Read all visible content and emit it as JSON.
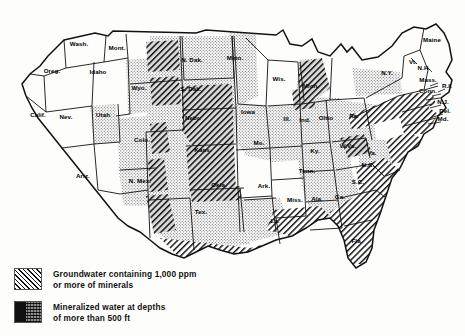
{
  "map": {
    "title": "Groundwater mineral content map of the contiguous United States",
    "states": [
      {
        "abbr": "Wash.",
        "x": 79,
        "y": 46
      },
      {
        "abbr": "Oreg.",
        "x": 52,
        "y": 73
      },
      {
        "abbr": "Calif.",
        "x": 38,
        "y": 117
      },
      {
        "abbr": "Idaho",
        "x": 98,
        "y": 74
      },
      {
        "abbr": "Mont.",
        "x": 117,
        "y": 50
      },
      {
        "abbr": "Wyo.",
        "x": 139,
        "y": 90
      },
      {
        "abbr": "Nev.",
        "x": 66,
        "y": 119
      },
      {
        "abbr": "Utah",
        "x": 103,
        "y": 117
      },
      {
        "abbr": "Colo.",
        "x": 142,
        "y": 142
      },
      {
        "abbr": "Ariz.",
        "x": 83,
        "y": 178
      },
      {
        "abbr": "N. Mex.",
        "x": 140,
        "y": 183
      },
      {
        "abbr": "N. Dak.",
        "x": 192,
        "y": 62
      },
      {
        "abbr": "S. Dak.",
        "x": 191,
        "y": 91
      },
      {
        "abbr": "Nebr.",
        "x": 193,
        "y": 120
      },
      {
        "abbr": "Kans.",
        "x": 203,
        "y": 152
      },
      {
        "abbr": "Okla.",
        "x": 219,
        "y": 187
      },
      {
        "abbr": "Tex.",
        "x": 201,
        "y": 214
      },
      {
        "abbr": "Minn.",
        "x": 235,
        "y": 60
      },
      {
        "abbr": "Iowa",
        "x": 248,
        "y": 114
      },
      {
        "abbr": "Mo.",
        "x": 259,
        "y": 145
      },
      {
        "abbr": "Ark.",
        "x": 264,
        "y": 188
      },
      {
        "abbr": "La.",
        "x": 275,
        "y": 223
      },
      {
        "abbr": "Wis.",
        "x": 279,
        "y": 81
      },
      {
        "abbr": "Ill.",
        "x": 287,
        "y": 121
      },
      {
        "abbr": "Mich.",
        "x": 311,
        "y": 88
      },
      {
        "abbr": "Ind.",
        "x": 305,
        "y": 122
      },
      {
        "abbr": "Ohio",
        "x": 326,
        "y": 120
      },
      {
        "abbr": "Ky.",
        "x": 315,
        "y": 153
      },
      {
        "abbr": "Tenn.",
        "x": 307,
        "y": 173
      },
      {
        "abbr": "Miss.",
        "x": 295,
        "y": 202
      },
      {
        "abbr": "Ala.",
        "x": 317,
        "y": 201
      },
      {
        "abbr": "Ga.",
        "x": 340,
        "y": 199
      },
      {
        "abbr": "Fla.",
        "x": 357,
        "y": 243
      },
      {
        "abbr": "S.C.",
        "x": 358,
        "y": 184
      },
      {
        "abbr": "N.C.",
        "x": 368,
        "y": 167
      },
      {
        "abbr": "W.Va.",
        "x": 348,
        "y": 148
      },
      {
        "abbr": "Va.",
        "x": 372,
        "y": 155
      },
      {
        "abbr": "Pa.",
        "x": 354,
        "y": 118
      },
      {
        "abbr": "N.Y.",
        "x": 387,
        "y": 75
      },
      {
        "abbr": "Vt.",
        "x": 413,
        "y": 64
      },
      {
        "abbr": "N.H.",
        "x": 424,
        "y": 70
      },
      {
        "abbr": "Maine",
        "x": 432,
        "y": 42
      },
      {
        "abbr": "Mass.",
        "x": 428,
        "y": 82
      },
      {
        "abbr": "Conn.",
        "x": 428,
        "y": 93
      },
      {
        "abbr": "R.I.",
        "x": 447,
        "y": 88
      },
      {
        "abbr": "N.J.",
        "x": 443,
        "y": 104
      },
      {
        "abbr": "Del.",
        "x": 445,
        "y": 113
      },
      {
        "abbr": "Md.",
        "x": 443,
        "y": 121
      }
    ]
  },
  "legend": {
    "items": [
      {
        "pattern": "diagonal-hatch",
        "label": "Groundwater containing 1,000 ppm\nor more of minerals"
      },
      {
        "pattern": "dense-block",
        "label": "Mineralized water at depths\nof more than 500 ft"
      }
    ]
  },
  "colors": {
    "ink": "#111111",
    "paper": "#fdfdfb",
    "stipple": "#9a9a9a"
  }
}
